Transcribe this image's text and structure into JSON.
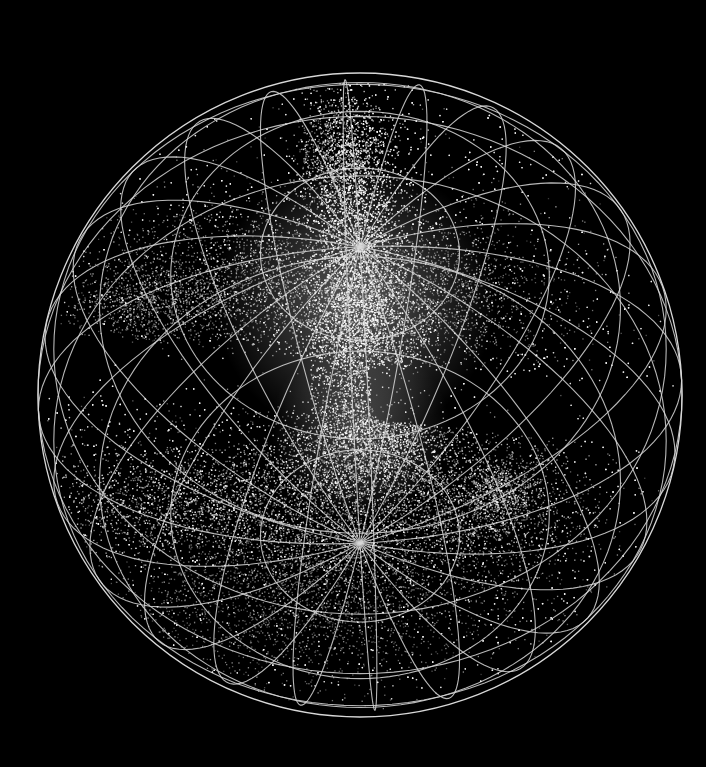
{
  "scene": {
    "background": "#000000",
    "point_color": "#ffffff",
    "grid_color": "#d8d8d8",
    "subject": "3D galaxy redshift survey rendered inside a wireframe sphere",
    "grid": {
      "latitude_lines": 9,
      "longitude_lines": 12
    },
    "view": {
      "tilt_deg": 62,
      "spin_deg": 18
    },
    "structures": [
      {
        "name": "northern-filament",
        "density": "high"
      },
      {
        "name": "southern-wall",
        "density": "high"
      },
      {
        "name": "zone-of-avoidance",
        "density": "empty"
      }
    ]
  }
}
